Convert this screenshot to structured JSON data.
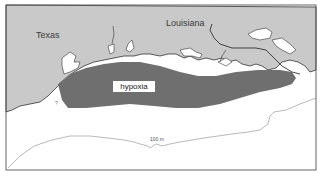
{
  "map": {
    "labels": {
      "texas": "Texas",
      "louisiana": "Louisiana",
      "hypoxia": "hypoxia",
      "contour": "100 m",
      "unknown_edge": "?"
    },
    "colors": {
      "land": "#c9c9c9",
      "water": "#ffffff",
      "hypoxia": "#6f6f6f",
      "frame": "#555555",
      "coastline": "#333333",
      "contour": "#8a8a8a"
    },
    "regions": [
      "Texas",
      "Louisiana",
      "Gulf of Mexico shelf",
      "hypoxic zone",
      "100 m isobath"
    ]
  }
}
